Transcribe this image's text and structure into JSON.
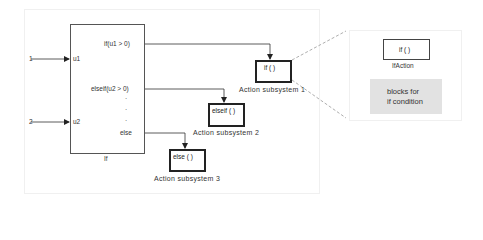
{
  "diagram": {
    "if_block": {
      "name": "If",
      "inputs": [
        {
          "port": "u1",
          "source_label": "1"
        },
        {
          "port": "u2",
          "source_label": "2"
        }
      ],
      "outputs": [
        "if(u1 > 0)",
        "elseif(u2 > 0)",
        "else"
      ],
      "ellipsis": [
        "·",
        "·",
        "·"
      ]
    },
    "subsystems": [
      {
        "block_text": "if ( )",
        "label": "Action subsystem 1"
      },
      {
        "block_text": "elseif ( )",
        "label": "Action subsystem 2"
      },
      {
        "block_text": "else ( )",
        "label": "Action subsystem 3"
      }
    ],
    "inset": {
      "block_text": "if ( )",
      "block_label": "IfAction",
      "note_line1": "blocks for",
      "note_line2": "if condition"
    }
  },
  "colors": {
    "line": "#333333",
    "dashed": "#999999",
    "note_bg": "#e2e2e2"
  }
}
